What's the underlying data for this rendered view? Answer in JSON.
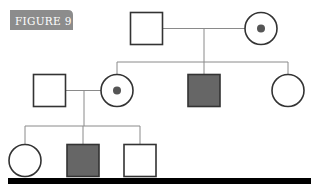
{
  "figure_label": "FIGURE 9",
  "colors": {
    "label_bg": "#8c8c8c",
    "label_text": "#ffffff",
    "stroke": "#333333",
    "line": "#8a8a8a",
    "affected_fill": "#666666",
    "carrier_dot": "#555555",
    "unaffected_fill": "#ffffff",
    "bottom_bar": "#000000"
  },
  "pedigree": {
    "generations": [
      {
        "name": "I",
        "individuals": [
          {
            "id": "I-1",
            "sex": "male",
            "status": "unaffected"
          },
          {
            "id": "I-2",
            "sex": "female",
            "status": "carrier"
          }
        ]
      },
      {
        "name": "II",
        "individuals": [
          {
            "id": "II-1",
            "sex": "male",
            "status": "unaffected",
            "relation": "spouse of II-2"
          },
          {
            "id": "II-2",
            "sex": "female",
            "status": "carrier",
            "relation": "child of I-1 x I-2"
          },
          {
            "id": "II-3",
            "sex": "male",
            "status": "affected",
            "relation": "child of I-1 x I-2"
          },
          {
            "id": "II-4",
            "sex": "female",
            "status": "unaffected",
            "relation": "child of I-1 x I-2"
          }
        ]
      },
      {
        "name": "III",
        "individuals": [
          {
            "id": "III-1",
            "sex": "female",
            "status": "unaffected",
            "relation": "child of II-1 x II-2"
          },
          {
            "id": "III-2",
            "sex": "male",
            "status": "affected",
            "relation": "child of II-1 x II-2"
          },
          {
            "id": "III-3",
            "sex": "male",
            "status": "unaffected",
            "relation": "child of II-1 x II-2"
          }
        ]
      }
    ]
  }
}
